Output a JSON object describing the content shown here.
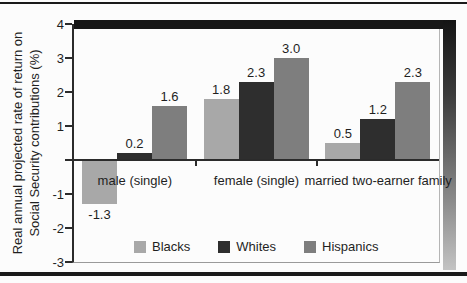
{
  "figure": {
    "background": "#fcfcfc",
    "rule_color": "#1a1a1a",
    "shadow_color_top": "#171717",
    "shadow_gradient_bottom": "#c3c3c3"
  },
  "chart_data": {
    "type": "bar",
    "title": "",
    "ylabel": "Real annual projected rate of return on Social Security contributions (%)",
    "ylabel_lines": [
      "Real annual projected rate of return on",
      "Social Security contributions (%)"
    ],
    "xlabel": "",
    "categories": [
      "male (single)",
      "female (single)",
      "married two-earner family"
    ],
    "series": [
      {
        "name": "Blacks",
        "color": "#a8a8a8",
        "values": [
          -1.3,
          1.8,
          0.5
        ]
      },
      {
        "name": "Whites",
        "color": "#2e2e2e",
        "values": [
          0.2,
          2.3,
          1.2
        ]
      },
      {
        "name": "Hispanics",
        "color": "#7e7e7e",
        "values": [
          1.6,
          3.0,
          2.3
        ]
      }
    ],
    "value_labels": [
      "-1.3",
      "0.2",
      "1.6",
      "1.8",
      "2.3",
      "3.0",
      "0.5",
      "1.2",
      "2.3"
    ],
    "ylim": [
      -3,
      4
    ],
    "yticks": [
      {
        "value": 4,
        "label": "4"
      },
      {
        "value": 3,
        "label": "3"
      },
      {
        "value": 2,
        "label": "2"
      },
      {
        "value": 1,
        "label": "1"
      },
      {
        "value": 0,
        "label": ""
      },
      {
        "value": -1,
        "label": "-1"
      },
      {
        "value": -2,
        "label": "-2"
      },
      {
        "value": -3,
        "label": "-3"
      }
    ],
    "grid": false,
    "legend_position": "bottom-center",
    "legend_entries": [
      "Blacks",
      "Whites",
      "Hispanics"
    ]
  }
}
